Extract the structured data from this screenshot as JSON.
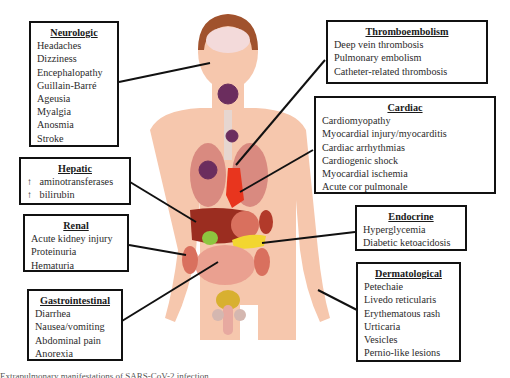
{
  "figure": {
    "colors": {
      "skin": "#f6c7ad",
      "hair": "#a0522d",
      "brain": "#f3dada",
      "lung": "#d98a80",
      "heart": "#e8351e",
      "liver": "#9b2d20",
      "gallbladder": "#8dc63f",
      "pancreas": "#f2d630",
      "intestine": "#eaa090",
      "virus": "#6b2d5e",
      "border": "#111111"
    }
  },
  "boxes": {
    "neurologic": {
      "title": "Neurologic",
      "items": [
        "Headaches",
        "Dizziness",
        "Encephalopathy",
        "Guillain-Barré",
        "Ageusia",
        "Myalgia",
        "Anosmia",
        "Stroke"
      ]
    },
    "thromboembolism": {
      "title": "Thromboembolism",
      "items": [
        "Deep vein thrombosis",
        "Pulmonary embolism",
        "Catheter-related thrombosis"
      ]
    },
    "cardiac": {
      "title": "Cardiac",
      "items": [
        "Cardiomyopathy",
        "Myocardial injury/myocarditis",
        "Cardiac arrhythmias",
        "Cardiogenic shock",
        "Myocardial ischemia",
        "Acute cor pulmonale"
      ]
    },
    "hepatic": {
      "title": "Hepatic",
      "arrow": "↑",
      "items": [
        "aminotransferases",
        "bilirubin"
      ]
    },
    "renal": {
      "title": "Renal",
      "items": [
        "Acute kidney injury",
        "Proteinuria",
        "Hematuria"
      ]
    },
    "endocrine": {
      "title": "Endocrine",
      "items": [
        "Hyperglycemia",
        "Diabetic ketoacidosis"
      ]
    },
    "gastrointestinal": {
      "title": "Gastrointestinal",
      "items": [
        "Diarrhea",
        "Nausea/vomiting",
        "Abdominal pain",
        "Anorexia"
      ]
    },
    "dermatological": {
      "title": "Dermatological",
      "items": [
        "Petechaie",
        "Livedo reticularis",
        "Erythematous rash",
        "Urticaria",
        "Vesicles",
        "Pernio-like lesions"
      ]
    }
  },
  "caption": "Extrapulmonary manifestations of SARS-CoV-2 infection"
}
